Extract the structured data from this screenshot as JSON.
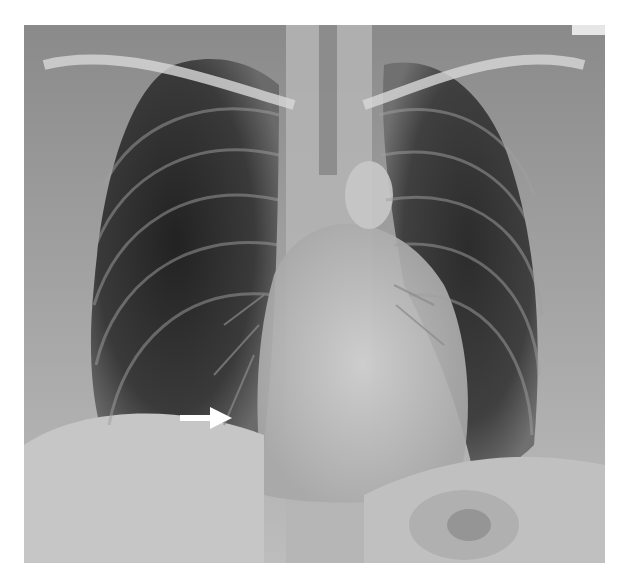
{
  "image": {
    "subject": "Chest X-ray, posteroanterior view",
    "annotation": "white arrow pointing to right lower lung zone near the cardiophrenic region",
    "colors": {
      "background": "#ffffff",
      "film_mid": "#7a7a7a",
      "lung_dark": "#2a2a2a",
      "bone_light": "#d8d8d8",
      "arrow": "#ffffff"
    }
  }
}
